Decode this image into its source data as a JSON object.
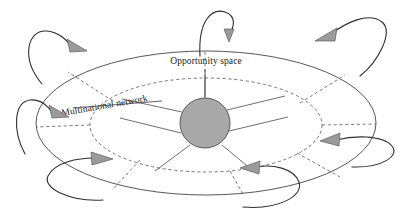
{
  "diagram": {
    "type": "concept-diagram",
    "canvas": {
      "width": 412,
      "height": 217,
      "background": "#ffffff"
    },
    "labels": {
      "opportunity_space": "Opportunity space",
      "multinational_network": "Multinational network"
    },
    "colors": {
      "hub_fill": "#a9a9a9",
      "hub_stroke": "#5a5a5a",
      "arrow_fill": "#9a9a9a",
      "arrow_stroke": "#5d5d5d",
      "line": "#444444",
      "text": "#1a1a1a"
    },
    "shapes": {
      "outer_ellipse": {
        "cx": 206,
        "cy": 123,
        "rx": 170,
        "ry": 72,
        "style": "solid",
        "name": "opportunity-space-boundary"
      },
      "inner_ellipse": {
        "cx": 206,
        "cy": 125,
        "rx": 116,
        "ry": 47,
        "style": "dashed",
        "name": "multinational-network-boundary"
      },
      "hub_circle": {
        "cx": 205,
        "cy": 123,
        "r": 25,
        "fill": "#a9a9a9",
        "name": "central-hub"
      }
    },
    "spokes_solid": [
      {
        "angle_deg": 270,
        "label": "spoke-north"
      },
      {
        "angle_deg": 330,
        "label": "spoke-northeast"
      },
      {
        "angle_deg": 25,
        "label": "spoke-east"
      },
      {
        "angle_deg": 70,
        "label": "spoke-southeast"
      },
      {
        "angle_deg": 110,
        "label": "spoke-southwest"
      },
      {
        "angle_deg": 155,
        "label": "spoke-west"
      },
      {
        "angle_deg": 210,
        "label": "spoke-northwest"
      }
    ],
    "arrows": [
      {
        "id": "arrow-top-center",
        "direction": "down",
        "position": "top-center"
      },
      {
        "id": "arrow-top-left",
        "direction": "down-right",
        "position": "top-left"
      },
      {
        "id": "arrow-top-right",
        "direction": "down-left",
        "position": "top-right"
      },
      {
        "id": "arrow-mid-left",
        "direction": "down-right",
        "position": "middle-left"
      },
      {
        "id": "arrow-mid-right",
        "direction": "left",
        "position": "middle-right"
      },
      {
        "id": "arrow-bottom-left",
        "direction": "right",
        "position": "bottom-left"
      },
      {
        "id": "arrow-bottom-center",
        "direction": "left",
        "position": "bottom-center-right"
      }
    ]
  }
}
